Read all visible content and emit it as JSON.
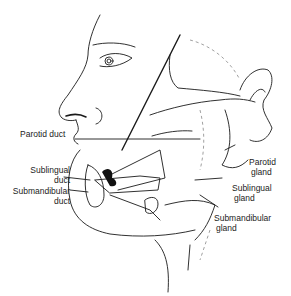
{
  "diagram": {
    "labels": {
      "parotid_duct": "Parotid duct",
      "sublingual_duct_1": "Sublingual",
      "sublingual_duct_2": "duct",
      "submandibular_duct_1": "Submandibular",
      "submandibular_duct_2": "duct",
      "parotid_gland_1": "Parotid",
      "parotid_gland_2": "gland",
      "sublingual_gland_1": "Sublingual",
      "sublingual_gland_2": "gland",
      "submandibular_gland_1": "Submandibular",
      "submandibular_gland_2": "gland"
    },
    "colors": {
      "line": "#1a1a1a",
      "background": "#ffffff",
      "dashed": "#888888"
    }
  }
}
